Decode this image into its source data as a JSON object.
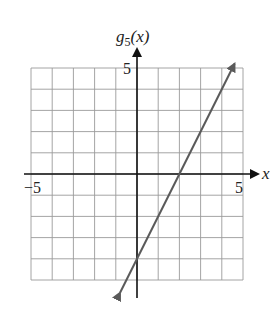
{
  "chart_data": {
    "type": "line",
    "title": "",
    "function_label": "g5(x)",
    "ylabel_main": "g",
    "ylabel_sub": "5",
    "ylabel_arg": "(x)",
    "xlabel": "x",
    "xlim": [
      -5,
      5
    ],
    "ylim": [
      -5,
      5
    ],
    "grid": true,
    "grid_step": 1,
    "x_tick_labels": [
      {
        "value": -5,
        "label": "−5"
      },
      {
        "value": 5,
        "label": "5"
      }
    ],
    "y_tick_labels": [
      {
        "value": 5,
        "label": "5"
      }
    ],
    "series": [
      {
        "name": "g5(x)",
        "equation": "g5(x) = 2x - 4",
        "slope": 2,
        "intercept": -4,
        "x": [
          -0.8,
          0,
          1,
          2,
          3,
          4,
          4.6
        ],
        "y": [
          -5.6,
          -4,
          -2,
          0,
          2,
          4,
          5.2
        ],
        "arrows": "both",
        "color": "#5a5a5a"
      }
    ]
  },
  "colors": {
    "grid": "#9a9a9a",
    "axis": "#111111",
    "line": "#5a5a5a"
  }
}
